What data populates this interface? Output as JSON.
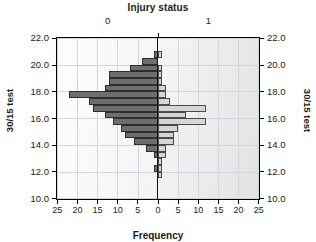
{
  "chart_data": {
    "type": "bar",
    "title": "Injury status",
    "xlabel": "Frequency",
    "ylabel": "30/15 test",
    "ylabel_right": "30/15 test",
    "orientation": "horizontal",
    "style": "back-to-back population pyramid histogram",
    "grid": true,
    "legend": "none",
    "group_labels": [
      "0",
      "1"
    ],
    "group_colors": [
      "#6e6e6e",
      "#d6d6d6"
    ],
    "xlim": [
      0,
      25
    ],
    "xticks": [
      25,
      20,
      15,
      10,
      5,
      0,
      5,
      10,
      15,
      20,
      25
    ],
    "ylim": [
      10.0,
      22.0
    ],
    "yticks": [
      "22.0",
      "20.0",
      "18.0",
      "16.0",
      "14.0",
      "12.0",
      "10.0"
    ],
    "bin_width": 0.5,
    "categories": [
      "10.0",
      "10.5",
      "11.0",
      "11.5",
      "12.0",
      "12.5",
      "13.0",
      "13.5",
      "14.0",
      "14.5",
      "15.0",
      "15.5",
      "16.0",
      "16.5",
      "17.0",
      "17.5",
      "18.0",
      "18.5",
      "19.0",
      "19.5",
      "20.0",
      "20.5",
      "21.0"
    ],
    "series": [
      {
        "name": "0",
        "label": "Injury status 0 (left, dark)",
        "values": [
          0,
          0,
          0,
          0,
          1,
          0,
          1,
          3,
          6,
          8,
          9,
          11,
          13,
          16,
          17,
          22,
          13,
          12,
          12,
          7,
          4,
          1,
          0
        ]
      },
      {
        "name": "1",
        "label": "Injury status 1 (right, light)",
        "values": [
          0,
          0,
          0,
          1,
          1,
          1,
          2,
          2,
          4,
          4,
          5,
          12,
          7,
          12,
          3,
          2,
          2,
          1,
          1,
          1,
          0,
          1,
          0
        ]
      }
    ]
  }
}
